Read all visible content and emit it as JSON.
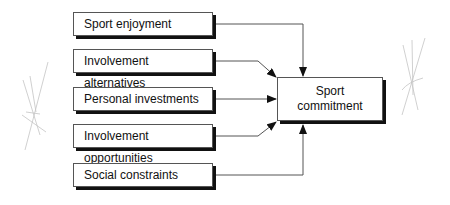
{
  "diagram": {
    "sources": [
      {
        "label": "Sport enjoyment",
        "top": 12
      },
      {
        "label": "Involvement alternatives",
        "top": 49
      },
      {
        "label": "Personal investments",
        "top": 87
      },
      {
        "label": "Involvement opportunities",
        "top": 124
      },
      {
        "label": "Social constraints",
        "top": 163
      }
    ],
    "target": {
      "line1": "Sport",
      "line2": "commitment"
    },
    "colors": {
      "line": "#555555",
      "shadow": "#111111",
      "sketch": "#bbbbbb"
    }
  }
}
